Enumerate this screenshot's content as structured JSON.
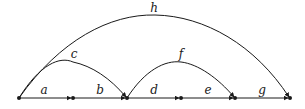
{
  "diagram": {
    "type": "directed-graph",
    "stroke_color": "#1a1a1a",
    "nodes": [
      {
        "id": "n0",
        "x": 19
      },
      {
        "id": "n1",
        "x": 73
      },
      {
        "id": "n2",
        "x": 127
      },
      {
        "id": "n3",
        "x": 181
      },
      {
        "id": "n4",
        "x": 235
      },
      {
        "id": "n5",
        "x": 290
      }
    ],
    "baseline_y": 98,
    "edges": [
      {
        "label": "a",
        "from": "n0",
        "to": "n1",
        "kind": "straight"
      },
      {
        "label": "b",
        "from": "n1",
        "to": "n2",
        "kind": "straight"
      },
      {
        "label": "d",
        "from": "n2",
        "to": "n3",
        "kind": "straight"
      },
      {
        "label": "e",
        "from": "n3",
        "to": "n4",
        "kind": "straight"
      },
      {
        "label": "g",
        "from": "n4",
        "to": "n5",
        "kind": "straight"
      },
      {
        "label": "c",
        "from": "n0",
        "to": "n2",
        "kind": "arc"
      },
      {
        "label": "f",
        "from": "n2",
        "to": "n4",
        "kind": "arc"
      },
      {
        "label": "h",
        "from": "n0",
        "to": "n5",
        "kind": "arc"
      }
    ],
    "labels": {
      "a": "a",
      "b": "b",
      "c": "c",
      "d": "d",
      "e": "e",
      "f": "f",
      "g": "g",
      "h": "h"
    }
  }
}
